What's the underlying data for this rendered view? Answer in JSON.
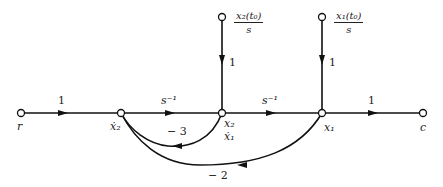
{
  "diagram": {
    "type": "signal-flow-graph",
    "nodes": [
      {
        "id": "r",
        "label": "r"
      },
      {
        "id": "x2dot",
        "label": "ẋ₂"
      },
      {
        "id": "x2",
        "label": "x₂",
        "sublabel": "ẋ₁"
      },
      {
        "id": "x1",
        "label": "x₁"
      },
      {
        "id": "c",
        "label": "c"
      },
      {
        "id": "ic2",
        "numerator": "x₂(t₀)",
        "denominator": "s"
      },
      {
        "id": "ic1",
        "numerator": "x₁(t₀)",
        "denominator": "s"
      }
    ],
    "branches": [
      {
        "from": "r",
        "to": "x2dot",
        "gain": "1"
      },
      {
        "from": "x2dot",
        "to": "x2",
        "gain": "s⁻¹"
      },
      {
        "from": "x2",
        "to": "x1",
        "gain": "s⁻¹"
      },
      {
        "from": "x1",
        "to": "c",
        "gain": "1"
      },
      {
        "from": "ic2",
        "to": "x2",
        "gain": "1"
      },
      {
        "from": "ic1",
        "to": "x1",
        "gain": "1"
      },
      {
        "from": "x2",
        "to": "x2dot",
        "gain": "− 3"
      },
      {
        "from": "x1",
        "to": "x2dot",
        "gain": "− 2"
      }
    ]
  }
}
